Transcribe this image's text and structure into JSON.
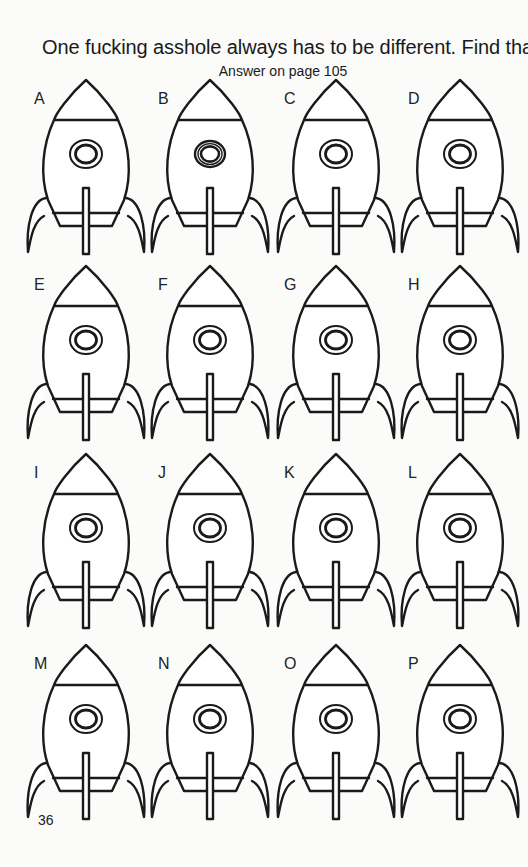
{
  "header": {
    "title": "One fucking asshole always has to be different. Find that cunt.",
    "subtitle": "Answer on page 105"
  },
  "puzzle": {
    "type": "spot-the-odd-one-out",
    "columns": 4,
    "rows": 4,
    "rockets": [
      {
        "label": "A",
        "window_rings": 2
      },
      {
        "label": "B",
        "window_rings": 3
      },
      {
        "label": "C",
        "window_rings": 2
      },
      {
        "label": "D",
        "window_rings": 2
      },
      {
        "label": "E",
        "window_rings": 2
      },
      {
        "label": "F",
        "window_rings": 2
      },
      {
        "label": "G",
        "window_rings": 2
      },
      {
        "label": "H",
        "window_rings": 2
      },
      {
        "label": "I",
        "window_rings": 2
      },
      {
        "label": "J",
        "window_rings": 2
      },
      {
        "label": "K",
        "window_rings": 2
      },
      {
        "label": "L",
        "window_rings": 2
      },
      {
        "label": "M",
        "window_rings": 2
      },
      {
        "label": "N",
        "window_rings": 2
      },
      {
        "label": "O",
        "window_rings": 2
      },
      {
        "label": "P",
        "window_rings": 2
      }
    ]
  },
  "footer": {
    "page_number": "36"
  },
  "colors": {
    "ink": "#1a1a1a",
    "paper": "#fbfbfa"
  }
}
